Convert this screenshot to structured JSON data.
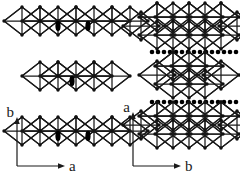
{
  "figure": {
    "type": "crystal-structure-polyhedral-diagram",
    "background_color": "#ffffff",
    "line_color": "#1a1a1a",
    "vertex_color": "#111111",
    "marker_color": "#000000",
    "panels": [
      {
        "id": "left-panel",
        "name": "projection-along-c",
        "axes": {
          "vertical_label": "b",
          "horizontal_label": "a"
        },
        "slabs": [
          {
            "id": "left-slab-top",
            "octahedra_count": 3,
            "interlayer_markers": "none",
            "cation_ellipses": 2
          },
          {
            "id": "left-slab-middle",
            "octahedra_count": 2,
            "interlayer_markers": "none",
            "cation_ellipses": 1
          },
          {
            "id": "left-slab-bottom",
            "octahedra_count": 3,
            "interlayer_markers": "none",
            "cation_ellipses": 2
          }
        ]
      },
      {
        "id": "right-panel",
        "name": "projection-along-c-rotated",
        "axes": {
          "vertical_label": "a",
          "horizontal_label": "b"
        },
        "slabs": [
          {
            "id": "right-slab-top",
            "octahedra_count": 3,
            "rows": 2,
            "interlayer_markers": "dots-below",
            "dot_count": 15
          },
          {
            "id": "right-slab-middle",
            "octahedra_count": 2,
            "rows": 2,
            "interlayer_markers": "dots-below",
            "dot_count": 15
          },
          {
            "id": "right-slab-bottom",
            "octahedra_count": 3,
            "rows": 2,
            "interlayer_markers": "none"
          }
        ]
      }
    ],
    "labels": {
      "left_vertical_axis": "b",
      "left_horizontal_axis": "a",
      "right_vertical_axis": "a",
      "right_horizontal_axis": "b"
    }
  }
}
